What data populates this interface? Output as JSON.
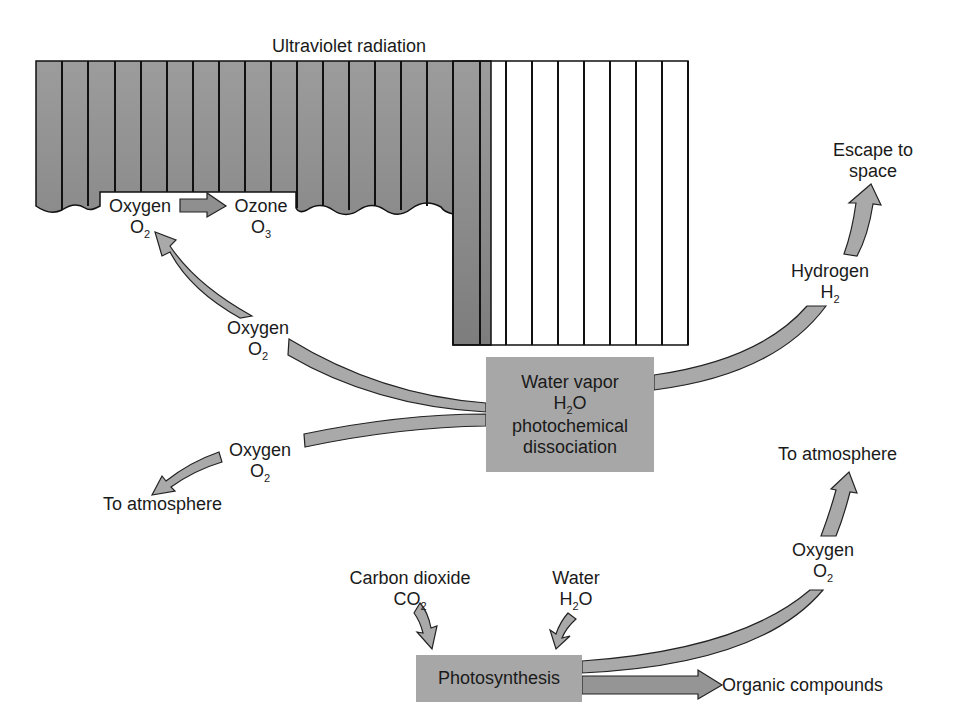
{
  "title_label": "Ultraviolet radiation",
  "colors": {
    "uv_fill": "#8e8e8e",
    "uv_lines": "#111111",
    "arrow_fill": "#a9a9a9",
    "arrow_stroke": "#222222",
    "box_fill": "#a7a7a7",
    "background": "#ffffff"
  },
  "ozone_reaction": {
    "reactant": "Oxygen",
    "reactant_formula_base": "O",
    "reactant_formula_sub": "2",
    "product": "Ozone",
    "product_formula_base": "O",
    "product_formula_sub": "3"
  },
  "dissociation_box": {
    "line1": "Water vapor",
    "formula_h": "H",
    "formula_sub": "2",
    "formula_o": "O",
    "line3": "photochemical",
    "line4": "dissociation"
  },
  "oxygen_upper": {
    "name": "Oxygen",
    "formula_base": "O",
    "formula_sub": "2"
  },
  "oxygen_lower": {
    "name": "Oxygen",
    "formula_base": "O",
    "formula_sub": "2",
    "destination": "To atmosphere"
  },
  "hydrogen": {
    "name": "Hydrogen",
    "formula_base": "H",
    "formula_sub": "2",
    "destination_line1": "Escape to",
    "destination_line2": "space"
  },
  "photosynthesis": {
    "box_label": "Photosynthesis",
    "input1_name": "Carbon dioxide",
    "input1_formula_base": "CO",
    "input1_formula_sub": "2",
    "input2_name": "Water",
    "input2_formula_h": "H",
    "input2_formula_sub": "2",
    "input2_formula_o": "O",
    "output_oxygen_name": "Oxygen",
    "output_oxygen_formula_base": "O",
    "output_oxygen_formula_sub": "2",
    "output_oxygen_destination": "To atmosphere",
    "output_organic": "Organic compounds"
  }
}
